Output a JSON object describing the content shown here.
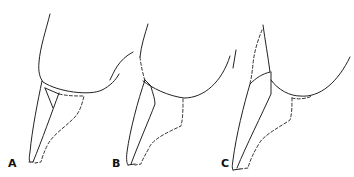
{
  "figure": {
    "type": "line-art diagram",
    "panels": [
      {
        "label": "A",
        "label_pos": {
          "x": 8,
          "y": 158
        }
      },
      {
        "label": "B",
        "label_pos": {
          "x": 112,
          "y": 158
        }
      },
      {
        "label": "C",
        "label_pos": {
          "x": 221,
          "y": 158
        }
      }
    ],
    "line_color": "#222222",
    "background": "#ffffff"
  }
}
